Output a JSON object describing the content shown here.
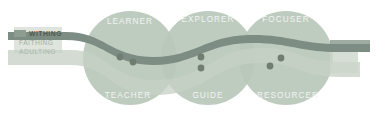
{
  "diagram": {
    "legend": {
      "items": [
        {
          "label": "WITHING",
          "color": "#7f8f84",
          "swatch": "#8d9d92"
        },
        {
          "label": "FAITHING",
          "color": "#9fb0a4",
          "swatch": "#b9c7bc"
        },
        {
          "label": "ADULTING",
          "color": "#a8b7ac",
          "swatch": "#cbd5c9"
        }
      ],
      "panel_color": "#dfe4dc"
    },
    "circles": [
      {
        "top_label": "LEARNER",
        "bottom_label": "TEACHER",
        "cx": 130,
        "cy": 58,
        "r": 47,
        "color": "#b9c8bb"
      },
      {
        "top_label": "EXPLORER",
        "bottom_label": "GUIDE",
        "cx": 208,
        "cy": 58,
        "r": 47,
        "color": "#b9c8bb"
      },
      {
        "top_label": "FOCUSER",
        "bottom_label": "RESOURCER",
        "cx": 286,
        "cy": 58,
        "r": 47,
        "color": "#b9c8bb"
      }
    ],
    "dots": [
      {
        "cx": 120,
        "cy": 57,
        "r": 3.4,
        "color": "#6f7d72"
      },
      {
        "cx": 133,
        "cy": 62,
        "r": 3.4,
        "color": "#6f7d72"
      },
      {
        "cx": 201,
        "cy": 57,
        "r": 3.4,
        "color": "#6f7d72"
      },
      {
        "cx": 201,
        "cy": 68,
        "r": 3.4,
        "color": "#6f7d72"
      },
      {
        "cx": 281,
        "cy": 58,
        "r": 3.4,
        "color": "#6f7d72"
      },
      {
        "cx": 270,
        "cy": 66,
        "r": 3.4,
        "color": "#6f7d72"
      }
    ],
    "wave": {
      "dark_band_color": "#7e8d83",
      "light_band_color": "#c6d1c6",
      "tail_color": "#99a89d"
    },
    "colors": {
      "background": "#ffffff",
      "circle_fill": "#b9c8bb",
      "circle_overlap": "#a6b8a9",
      "label_text": "#f2f4f1"
    }
  }
}
